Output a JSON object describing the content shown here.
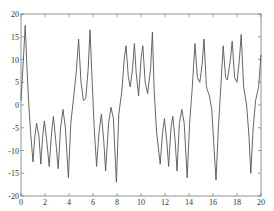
{
  "chart_data": {
    "type": "line",
    "title": "",
    "xlabel": "",
    "ylabel": "",
    "xlim": [
      0,
      20
    ],
    "ylim": [
      -20,
      20
    ],
    "grid": false,
    "legend": null,
    "x_ticks": [
      0,
      2,
      4,
      6,
      8,
      10,
      12,
      14,
      16,
      18,
      20
    ],
    "y_ticks": [
      -20,
      -15,
      -10,
      -5,
      0,
      5,
      10,
      15,
      20
    ],
    "series": [
      {
        "name": "signal",
        "color": "#555555",
        "points": [
          [
            0.0,
            1.0
          ],
          [
            0.2,
            10.0
          ],
          [
            0.35,
            17.5
          ],
          [
            0.5,
            8.0
          ],
          [
            0.65,
            0.0
          ],
          [
            0.8,
            -6.0
          ],
          [
            1.0,
            -12.5
          ],
          [
            1.15,
            -7.0
          ],
          [
            1.3,
            -4.0
          ],
          [
            1.5,
            -7.0
          ],
          [
            1.65,
            -13.0
          ],
          [
            1.8,
            -7.0
          ],
          [
            1.95,
            -3.5
          ],
          [
            2.15,
            -8.0
          ],
          [
            2.35,
            -13.5
          ],
          [
            2.55,
            -6.0
          ],
          [
            2.7,
            -2.5
          ],
          [
            2.9,
            -8.0
          ],
          [
            3.1,
            -14.0
          ],
          [
            3.3,
            -5.0
          ],
          [
            3.5,
            -1.0
          ],
          [
            3.7,
            -5.0
          ],
          [
            3.95,
            -16.0
          ],
          [
            4.15,
            -4.0
          ],
          [
            4.4,
            2.0
          ],
          [
            4.6,
            7.0
          ],
          [
            4.8,
            14.5
          ],
          [
            5.0,
            5.0
          ],
          [
            5.2,
            1.0
          ],
          [
            5.4,
            1.5
          ],
          [
            5.6,
            8.0
          ],
          [
            5.75,
            16.5
          ],
          [
            5.95,
            4.0
          ],
          [
            6.1,
            -5.0
          ],
          [
            6.3,
            -13.5
          ],
          [
            6.5,
            -6.0
          ],
          [
            6.7,
            -2.0
          ],
          [
            6.9,
            -8.0
          ],
          [
            7.05,
            -14.5
          ],
          [
            7.3,
            -4.0
          ],
          [
            7.5,
            -0.5
          ],
          [
            7.7,
            -3.0
          ],
          [
            7.95,
            -17.0
          ],
          [
            8.15,
            -2.0
          ],
          [
            8.4,
            3.0
          ],
          [
            8.6,
            10.0
          ],
          [
            8.75,
            13.0
          ],
          [
            8.95,
            6.0
          ],
          [
            9.1,
            4.0
          ],
          [
            9.3,
            8.0
          ],
          [
            9.45,
            13.5
          ],
          [
            9.6,
            7.0
          ],
          [
            9.8,
            2.0
          ],
          [
            10.0,
            10.0
          ],
          [
            10.15,
            13.0
          ],
          [
            10.35,
            5.0
          ],
          [
            10.55,
            2.5
          ],
          [
            10.8,
            8.0
          ],
          [
            10.95,
            16.0
          ],
          [
            11.1,
            3.0
          ],
          [
            11.3,
            -6.0
          ],
          [
            11.6,
            -13.0
          ],
          [
            11.8,
            -6.0
          ],
          [
            11.95,
            -3.0
          ],
          [
            12.15,
            -8.0
          ],
          [
            12.3,
            -13.5
          ],
          [
            12.5,
            -5.0
          ],
          [
            12.65,
            -2.5
          ],
          [
            12.85,
            -8.0
          ],
          [
            13.0,
            -14.5
          ],
          [
            13.2,
            -4.0
          ],
          [
            13.4,
            -1.0
          ],
          [
            13.6,
            -4.0
          ],
          [
            13.85,
            -16.0
          ],
          [
            14.05,
            -4.0
          ],
          [
            14.25,
            3.0
          ],
          [
            14.5,
            13.5
          ],
          [
            14.7,
            6.0
          ],
          [
            14.9,
            5.0
          ],
          [
            15.1,
            9.0
          ],
          [
            15.25,
            14.5
          ],
          [
            15.45,
            4.0
          ],
          [
            15.7,
            2.0
          ],
          [
            15.9,
            -1.0
          ],
          [
            16.1,
            -10.0
          ],
          [
            16.25,
            -16.5
          ],
          [
            16.45,
            -5.0
          ],
          [
            16.65,
            4.0
          ],
          [
            16.85,
            13.0
          ],
          [
            17.05,
            6.0
          ],
          [
            17.2,
            5.5
          ],
          [
            17.45,
            10.0
          ],
          [
            17.6,
            14.0
          ],
          [
            17.8,
            6.0
          ],
          [
            18.0,
            5.0
          ],
          [
            18.2,
            10.0
          ],
          [
            18.35,
            15.5
          ],
          [
            18.55,
            4.0
          ],
          [
            18.8,
            0.0
          ],
          [
            19.0,
            -7.0
          ],
          [
            19.15,
            -15.0
          ],
          [
            19.35,
            -5.0
          ],
          [
            19.55,
            1.0
          ],
          [
            19.8,
            4.0
          ],
          [
            20.0,
            11.0
          ]
        ]
      }
    ]
  }
}
